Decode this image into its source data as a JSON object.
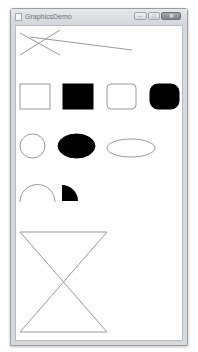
{
  "window": {
    "title": "GraphicsDemo",
    "controls": {
      "minimize": "–",
      "maximize": "□",
      "close": "✕"
    }
  },
  "colors": {
    "stroke": "#9a9a9a",
    "fill": "#000000",
    "frame": "#d6d9dd",
    "client_bg": "#ffffff"
  },
  "drawing": {
    "lines": [
      {
        "x1": 20,
        "y1": 33,
        "x2": 60,
        "y2": 55
      },
      {
        "x1": 20,
        "y1": 55,
        "x2": 60,
        "y2": 30
      },
      {
        "x1": 30,
        "y1": 37,
        "x2": 132,
        "y2": 50
      }
    ],
    "rectangles": [
      {
        "x": 20,
        "y": 84,
        "w": 30,
        "h": 25,
        "rx": 0,
        "filled": false
      },
      {
        "x": 63,
        "y": 84,
        "w": 30,
        "h": 25,
        "rx": 0,
        "filled": true
      },
      {
        "x": 107,
        "y": 84,
        "w": 29,
        "h": 25,
        "rx": 4,
        "filled": false
      },
      {
        "x": 150,
        "y": 84,
        "w": 29,
        "h": 25,
        "rx": 8,
        "filled": true
      }
    ],
    "ellipses": [
      {
        "cx": 32.5,
        "cy": 146,
        "rx": 12.5,
        "ry": 12,
        "filled": false
      },
      {
        "cx": 76.5,
        "cy": 146,
        "rx": 18.5,
        "ry": 12,
        "filled": true
      },
      {
        "cx": 131,
        "cy": 148,
        "rx": 24,
        "ry": 9,
        "filled": false
      }
    ],
    "arc": {
      "cx": 37.5,
      "cy": 202,
      "r": 17.5,
      "start_deg": 180,
      "end_deg": 0
    },
    "pie": {
      "cx": 62,
      "cy": 201,
      "r": 16,
      "start_deg": 270,
      "end_deg": 360
    },
    "hourglass": {
      "top_y": 232,
      "bottom_y": 332,
      "left_x": 20,
      "right_x": 107
    }
  }
}
